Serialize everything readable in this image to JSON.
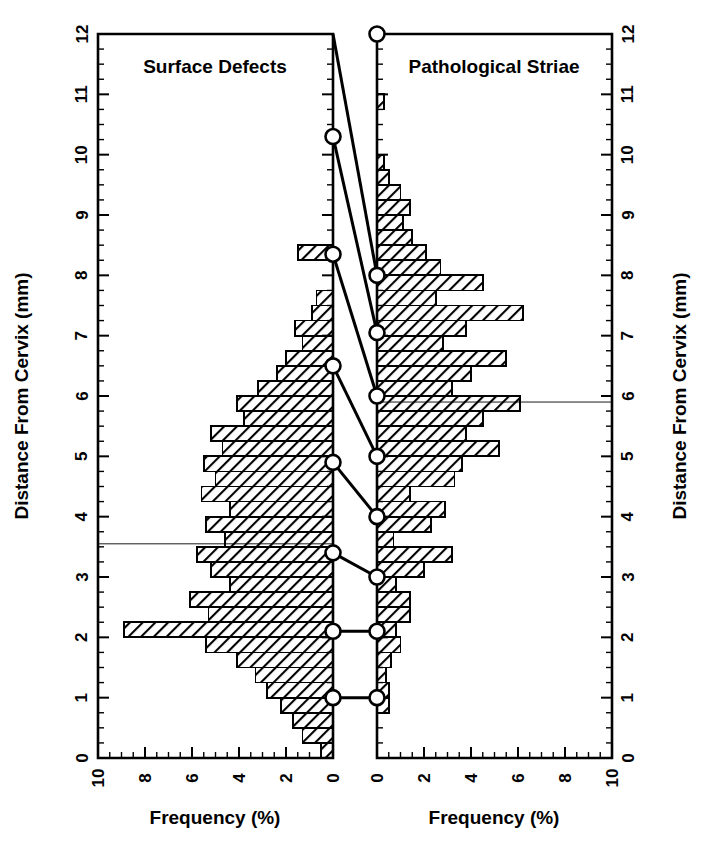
{
  "figure": {
    "background": "#ffffff",
    "ink_color": "#000000",
    "bar_fill": "hatch-diagonal",
    "marker_shape": "open-circle"
  },
  "axes": {
    "y_title": "Distance From Cervix (mm)",
    "x_title": "Frequency (%)",
    "y_ticks": [
      "0",
      "1",
      "2",
      "3",
      "4",
      "5",
      "6",
      "7",
      "8",
      "9",
      "10",
      "11",
      "12"
    ],
    "y_range": [
      0,
      12
    ],
    "left_x_ticks": [
      "10",
      "8",
      "6",
      "4",
      "2",
      "0"
    ],
    "right_x_ticks": [
      "0",
      "2",
      "4",
      "6",
      "8",
      "10"
    ],
    "x_range": [
      0,
      10
    ],
    "minor_tick_step": 0.5,
    "y_minor_tick_step": 0.25
  },
  "chart_data": {
    "type": "bar",
    "title": "",
    "xlabel": "Frequency (%)",
    "ylabel": "Distance From Cervix (mm)",
    "xlim": [
      0,
      10
    ],
    "ylim": [
      0,
      12
    ],
    "grid": false,
    "orientation": "horizontal",
    "bin_width": 0.25,
    "panels": [
      {
        "name": "left",
        "title": "Surface Defects",
        "direction": "leftward",
        "reference_line_y": 3.55,
        "bins": [
          0.125,
          0.375,
          0.625,
          0.875,
          1.125,
          1.375,
          1.625,
          1.875,
          2.125,
          2.375,
          2.625,
          2.875,
          3.125,
          3.375,
          3.625,
          3.875,
          4.125,
          4.375,
          4.625,
          4.875,
          5.125,
          5.375,
          5.625,
          5.875,
          6.125,
          6.375,
          6.625,
          6.875,
          7.125,
          7.375,
          7.625,
          7.875,
          8.125,
          8.375,
          8.625
        ],
        "values": [
          0.5,
          1.3,
          1.7,
          2.2,
          2.8,
          3.3,
          4.1,
          5.4,
          8.9,
          5.3,
          6.1,
          4.4,
          5.2,
          5.8,
          4.6,
          5.4,
          4.4,
          5.6,
          5.0,
          5.5,
          4.7,
          5.2,
          3.8,
          4.1,
          3.2,
          2.4,
          2.0,
          1.3,
          1.6,
          0.9,
          0.7,
          0.0,
          0.0,
          1.5,
          0.0
        ],
        "markers": [
          {
            "y": 1.0,
            "x": 0
          },
          {
            "y": 2.1,
            "x": 0
          },
          {
            "y": 3.4,
            "x": 0
          },
          {
            "y": 4.9,
            "x": 0
          },
          {
            "y": 6.5,
            "x": 0
          },
          {
            "y": 8.35,
            "x": 0
          },
          {
            "y": 10.3,
            "x": 0
          }
        ]
      },
      {
        "name": "right",
        "title": "Pathological Striae",
        "direction": "rightward",
        "reference_line_y": 5.9,
        "bins": [
          0.875,
          1.125,
          1.375,
          1.625,
          1.875,
          2.125,
          2.375,
          2.625,
          2.875,
          3.125,
          3.375,
          3.625,
          3.875,
          4.125,
          4.375,
          4.625,
          4.875,
          5.125,
          5.375,
          5.625,
          5.875,
          6.125,
          6.375,
          6.625,
          6.875,
          7.125,
          7.375,
          7.625,
          7.875,
          8.125,
          8.375,
          8.625,
          8.875,
          9.125,
          9.375,
          9.625,
          9.875,
          10.875
        ],
        "values": [
          0.5,
          0.5,
          0.4,
          0.6,
          1.0,
          0.8,
          1.4,
          1.4,
          0.8,
          2.0,
          3.2,
          0.7,
          2.3,
          2.9,
          1.4,
          3.3,
          3.6,
          5.2,
          3.8,
          4.5,
          6.1,
          3.2,
          4.0,
          5.5,
          2.8,
          3.8,
          6.2,
          2.5,
          4.5,
          2.7,
          2.1,
          1.5,
          1.1,
          1.4,
          1.0,
          0.5,
          0.3,
          0.3
        ],
        "markers": [
          {
            "y": 1.0,
            "x": 0
          },
          {
            "y": 2.1,
            "x": 0
          },
          {
            "y": 3.0,
            "x": 0
          },
          {
            "y": 4.0,
            "x": 0
          },
          {
            "y": 5.0,
            "x": 0
          },
          {
            "y": 6.0,
            "x": 0
          },
          {
            "y": 7.05,
            "x": 0
          },
          {
            "y": 8.0,
            "x": 0
          },
          {
            "y": 12.0,
            "x": 0
          }
        ]
      }
    ],
    "connectors": [
      {
        "from_panel": "left",
        "from_y": 1.0,
        "to_panel": "right",
        "to_y": 1.0
      },
      {
        "from_panel": "left",
        "from_y": 2.1,
        "to_panel": "right",
        "to_y": 2.1
      },
      {
        "from_panel": "left",
        "from_y": 3.4,
        "to_panel": "right",
        "to_y": 3.0
      },
      {
        "from_panel": "left",
        "from_y": 4.9,
        "to_panel": "right",
        "to_y": 4.0
      },
      {
        "from_panel": "left",
        "from_y": 6.5,
        "to_panel": "right",
        "to_y": 5.0
      },
      {
        "from_panel": "left",
        "from_y": 8.35,
        "to_panel": "right",
        "to_y": 6.0
      },
      {
        "from_panel": "left",
        "from_y": 10.3,
        "to_panel": "right",
        "to_y": 7.05
      },
      {
        "from_panel": "left",
        "from_y": 12.0,
        "to_panel": "right",
        "to_y": 8.0
      }
    ]
  }
}
